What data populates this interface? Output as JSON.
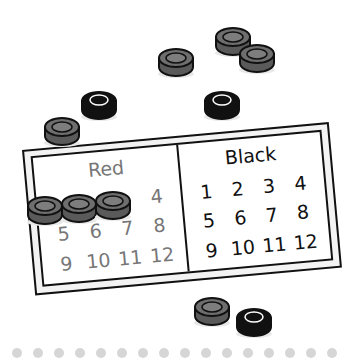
{
  "scene": {
    "description": "Illustration of a checkers counting board with loose checker pieces",
    "colors": {
      "red_piece_top": "#6e6e6e",
      "red_piece_side": "#5a5a5a",
      "black_piece": "#111111",
      "outline": "#111111",
      "red_text": "#777777",
      "black_text": "#111111",
      "dot": "#d6d6d6"
    }
  },
  "board": {
    "red": {
      "title": "Red",
      "numbers": [
        "1",
        "2",
        "3",
        "4",
        "5",
        "6",
        "7",
        "8",
        "9",
        "10",
        "11",
        "12"
      ],
      "covered": [
        1,
        2,
        3
      ]
    },
    "black": {
      "title": "Black",
      "numbers": [
        "1",
        "2",
        "3",
        "4",
        "5",
        "6",
        "7",
        "8",
        "9",
        "10",
        "11",
        "12"
      ],
      "covered": []
    }
  },
  "loose_pieces": [
    {
      "color": "red",
      "x": 176,
      "y": 61
    },
    {
      "color": "red",
      "x": 233,
      "y": 40
    },
    {
      "color": "red",
      "x": 257,
      "y": 57
    },
    {
      "color": "black",
      "x": 99,
      "y": 104
    },
    {
      "color": "black",
      "x": 222,
      "y": 104
    },
    {
      "color": "red",
      "x": 62,
      "y": 130
    },
    {
      "color": "red",
      "x": 212,
      "y": 310
    },
    {
      "color": "black",
      "x": 254,
      "y": 321
    }
  ],
  "on_board_pieces": [
    {
      "color": "red",
      "x": 45,
      "y": 209
    },
    {
      "color": "red",
      "x": 79,
      "y": 207
    },
    {
      "color": "red",
      "x": 113,
      "y": 204
    }
  ],
  "footer_dots": 16
}
